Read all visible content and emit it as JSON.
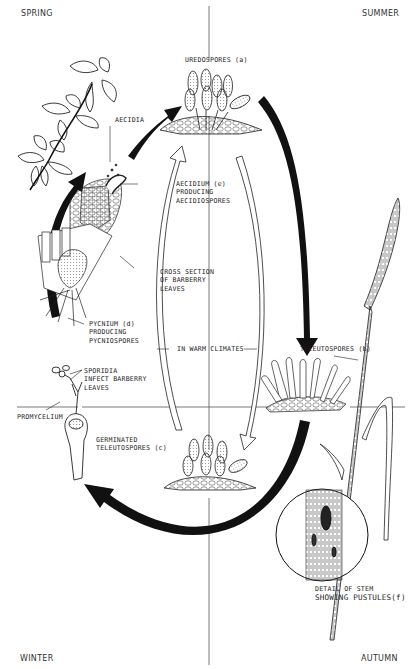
{
  "diagram": {
    "seasons": {
      "top_left": "SPRING",
      "top_right": "SUMMER",
      "bottom_left": "WINTER",
      "bottom_right": "AUTUMN"
    },
    "labels": {
      "uredospores": "UREDOSPORES (a)",
      "aecidia": "AECIDIA",
      "aecidium_1": "AECIDIUM (e)",
      "aecidium_2": "PRODUCING",
      "aecidium_3": "AECIDIOSPORES",
      "cross_section_1": "CROSS SECTION",
      "cross_section_2": "OF BARBERRY",
      "cross_section_3": "LEAVES",
      "pycnium_1": "PYCNIUM (d)",
      "pycnium_2": "PRODUCING",
      "pycnium_3": "PYCNIOSPORES",
      "warm_climates": "IN WARM CLIMATES",
      "teleutospores_b": "TELEUTOSPORES (b)",
      "sporidia_1": "SPORIDIA",
      "sporidia_2": "INFECT BARBERRY",
      "sporidia_3": "LEAVES",
      "promycelium": "PROMYCELIUM",
      "germinated_1": "GERMINATED",
      "germinated_2": "TELEUTOSPORES (c)",
      "detail_1": "DETAIL OF STEM",
      "detail_2": "SHOWING PUSTULES(f)"
    },
    "colors": {
      "ink": "#1a1a1a",
      "background": "#ffffff",
      "axis_line": "#555555"
    }
  }
}
